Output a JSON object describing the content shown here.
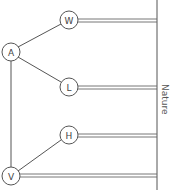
{
  "diagram": {
    "nodes": [
      {
        "id": "A",
        "label": "A",
        "x": 11,
        "y": 52
      },
      {
        "id": "W",
        "label": "W",
        "x": 69,
        "y": 20
      },
      {
        "id": "L",
        "label": "L",
        "x": 69,
        "y": 87
      },
      {
        "id": "H",
        "label": "H",
        "x": 69,
        "y": 135
      },
      {
        "id": "V",
        "label": "V",
        "x": 11,
        "y": 176
      }
    ],
    "edges": [
      {
        "from": "A",
        "to": "W"
      },
      {
        "from": "A",
        "to": "L"
      },
      {
        "from": "A",
        "to": "V"
      },
      {
        "from": "V",
        "to": "H"
      }
    ],
    "connections_to_nature": [
      "W",
      "L",
      "H",
      "V"
    ],
    "nature_line_x": 157,
    "nature_label": "Nature",
    "colors": {
      "line": "#555555",
      "background": "#ffffff"
    }
  }
}
